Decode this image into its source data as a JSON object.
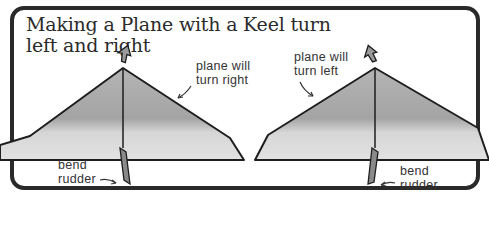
{
  "title": {
    "line1": "Making a Plane with a Keel turn",
    "line2": "left and right"
  },
  "diagrams": [
    {
      "name": "plane-turn-right",
      "annotation": [
        "plane will",
        "turn right"
      ],
      "rudder_label": [
        "bend",
        "rudder"
      ]
    },
    {
      "name": "plane-turn-left",
      "annotation": [
        "plane will",
        "turn left"
      ],
      "rudder_label": [
        "bend",
        "rudder"
      ]
    }
  ],
  "colors": {
    "frame": "#2a2a2a",
    "wing_dark": "#a9a9a9",
    "wing_light": "#dcdcdc",
    "outline": "#1e1e1e",
    "rudder": "#8a8a8a"
  }
}
